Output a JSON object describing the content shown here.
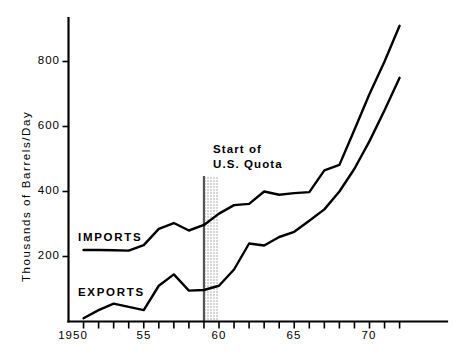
{
  "chart_data": {
    "type": "line",
    "title": "",
    "xlabel": "",
    "ylabel": "Thousands of Barrels/Day",
    "xlim": [
      1950,
      1972
    ],
    "ylim": [
      0,
      920
    ],
    "grid": false,
    "legend": "inline-labels",
    "ytick_labels": [
      "800",
      "600",
      "400",
      "200"
    ],
    "ytick_values": [
      800,
      600,
      400,
      200
    ],
    "xtick_labels": [
      "1950",
      "55",
      "60",
      "65",
      "70"
    ],
    "xtick_values": [
      1950,
      1955,
      1960,
      1965,
      1970
    ],
    "xtick_minor_step": 1,
    "annotations": [
      {
        "name": "start-of-us-quota",
        "line1": "Start of",
        "line2": "U.S. Quota",
        "x_start": 1959,
        "x_end": 1960,
        "style": "shaded-band-with-rule"
      }
    ],
    "x": [
      1951,
      1952,
      1953,
      1954,
      1955,
      1956,
      1957,
      1958,
      1959,
      1960,
      1961,
      1962,
      1963,
      1964,
      1965,
      1966,
      1967,
      1968,
      1969,
      1970,
      1971,
      1972
    ],
    "series": [
      {
        "name": "IMPORTS",
        "label_x": 1951.6,
        "label_y": 248,
        "values": [
          220,
          220,
          219,
          218,
          235,
          285,
          303,
          280,
          297,
          332,
          358,
          362,
          400,
          390,
          395,
          398,
          465,
          482,
          590,
          700,
          800,
          910
        ]
      },
      {
        "name": "EXPORTS",
        "label_x": 1951.6,
        "label_y": 128,
        "values": [
          10,
          35,
          55,
          45,
          35,
          110,
          145,
          95,
          97,
          110,
          160,
          240,
          234,
          260,
          276,
          310,
          345,
          400,
          470,
          555,
          650,
          750
        ]
      }
    ]
  }
}
